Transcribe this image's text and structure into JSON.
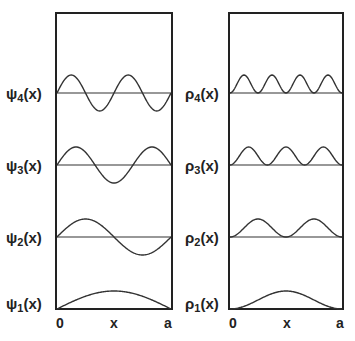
{
  "panels": {
    "left": {
      "title": "wavefunctions",
      "labels": [
        {
          "greek": "ψ",
          "n": "4",
          "arg": "(x)"
        },
        {
          "greek": "ψ",
          "n": "3",
          "arg": "(x)"
        },
        {
          "greek": "ψ",
          "n": "2",
          "arg": "(x)"
        },
        {
          "greek": "ψ",
          "n": "1",
          "arg": "(x)"
        }
      ],
      "axis": {
        "left": "0",
        "mid": "x",
        "right": "a"
      }
    },
    "right": {
      "title": "probability densities",
      "labels": [
        {
          "greek": "ρ",
          "n": "4",
          "arg": "(x)"
        },
        {
          "greek": "ρ",
          "n": "3",
          "arg": "(x)"
        },
        {
          "greek": "ρ",
          "n": "2",
          "arg": "(x)"
        },
        {
          "greek": "ρ",
          "n": "1",
          "arg": "(x)"
        }
      ],
      "axis": {
        "left": "0",
        "mid": "x",
        "right": "a"
      }
    }
  },
  "colors": {
    "line": "#333333",
    "frame": "#222222",
    "text": "#222222",
    "background": "#ffffff"
  },
  "chart_data": [
    {
      "type": "line",
      "title": "ψn(x)",
      "xlabel": "x",
      "x_ticks": [
        "0",
        "x",
        "a"
      ],
      "xlim": [
        0,
        1
      ],
      "formula": "psi_n(x) = sin(n*pi*x/a)",
      "grid": false,
      "legend": "none (row labels at left)",
      "x": [
        0,
        0.125,
        0.25,
        0.375,
        0.5,
        0.625,
        0.75,
        0.875,
        1
      ],
      "series": [
        {
          "name": "ψ4(x)",
          "n": 4,
          "values": [
            0,
            1,
            0,
            -1,
            0,
            1,
            0,
            -1,
            0
          ]
        },
        {
          "name": "ψ3(x)",
          "n": 3,
          "values": [
            0,
            0.924,
            0.707,
            -0.383,
            -1,
            -0.383,
            0.707,
            0.924,
            0
          ]
        },
        {
          "name": "ψ2(x)",
          "n": 2,
          "values": [
            0,
            0.707,
            1,
            0.707,
            0,
            -0.707,
            -1,
            -0.707,
            0
          ]
        },
        {
          "name": "ψ1(x)",
          "n": 1,
          "values": [
            0,
            0.383,
            0.707,
            0.924,
            1,
            0.924,
            0.707,
            0.383,
            0
          ]
        }
      ]
    },
    {
      "type": "line",
      "title": "ρn(x)",
      "xlabel": "x",
      "x_ticks": [
        "0",
        "x",
        "a"
      ],
      "xlim": [
        0,
        1
      ],
      "formula": "rho_n(x) = sin^2(n*pi*x/a)",
      "grid": false,
      "legend": "none (row labels at left)",
      "x": [
        0,
        0.125,
        0.25,
        0.375,
        0.5,
        0.625,
        0.75,
        0.875,
        1
      ],
      "series": [
        {
          "name": "ρ4(x)",
          "n": 4,
          "values": [
            0,
            1,
            0,
            1,
            0,
            1,
            0,
            1,
            0
          ]
        },
        {
          "name": "ρ3(x)",
          "n": 3,
          "values": [
            0,
            0.854,
            0.5,
            0.146,
            1,
            0.146,
            0.5,
            0.854,
            0
          ]
        },
        {
          "name": "ρ2(x)",
          "n": 2,
          "values": [
            0,
            0.5,
            1,
            0.5,
            0,
            0.5,
            1,
            0.5,
            0
          ]
        },
        {
          "name": "ρ1(x)",
          "n": 1,
          "values": [
            0,
            0.146,
            0.5,
            0.854,
            1,
            0.854,
            0.5,
            0.146,
            0
          ]
        }
      ]
    }
  ]
}
